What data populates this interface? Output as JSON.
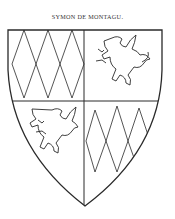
{
  "caption": "SYMON DE MONTAGU.",
  "shield": {
    "blazon": "Quarterly, 1 and 4 lozengy, 2 and 3 a griffin segreant",
    "quarters": [
      {
        "position": "1",
        "charge": "lozengy"
      },
      {
        "position": "2",
        "charge": "griffin-segreant"
      },
      {
        "position": "3",
        "charge": "griffin-segreant"
      },
      {
        "position": "4",
        "charge": "lozengy"
      }
    ]
  },
  "colors": {
    "ink": "#2a2a2a",
    "background": "#ffffff"
  }
}
